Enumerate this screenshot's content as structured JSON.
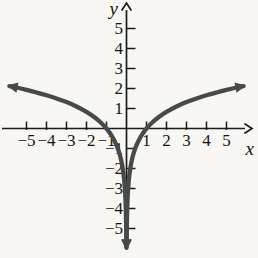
{
  "figure": {
    "background": "#f8f7f4",
    "axis_color": "#1b1b1b",
    "curve_color": "#494949",
    "label_color": "#141414"
  },
  "chart_data": {
    "type": "line",
    "title": "",
    "xlabel": "x",
    "ylabel": "y",
    "xlim": [
      -6,
      6
    ],
    "ylim": [
      -6.3,
      6.3
    ],
    "grid": false,
    "legend": "none",
    "x_ticks": [
      -5,
      -4,
      -3,
      -2,
      -1,
      1,
      2,
      3,
      4,
      5
    ],
    "x_tick_labels": [
      "−5",
      "−4",
      "−3",
      "−2",
      "−1",
      "1",
      "2",
      "3",
      "4",
      "5"
    ],
    "y_ticks": [
      5,
      4,
      3,
      2,
      1,
      -1,
      -2,
      -3,
      -4,
      -5
    ],
    "y_tick_labels": [
      "5",
      "4",
      "3",
      "2",
      "1",
      "−1",
      "−2",
      "−3",
      "−4",
      "−5"
    ],
    "curve_description": "Logarithmic curve of |x|: passes through (-1,0) and (1,0), falls to negative infinity as x approaches 0 (downward arrow at bottom of y-axis), rises slowly toward upper-left and upper-right arrows near y = 2 at |x| = 5.9",
    "series": [
      {
        "name": "left branch",
        "points": [
          [
            -0.007,
            -5.95
          ],
          [
            -0.011,
            -5.41
          ],
          [
            -0.018,
            -4.82
          ],
          [
            -0.03,
            -4.21
          ],
          [
            -0.05,
            -3.59
          ],
          [
            -0.075,
            -3.11
          ],
          [
            -0.11,
            -2.65
          ],
          [
            -0.16,
            -2.2
          ],
          [
            -0.22,
            -1.82
          ],
          [
            -0.3,
            -1.44
          ],
          [
            -0.4,
            -1.1
          ],
          [
            -0.5,
            -0.83
          ],
          [
            -0.65,
            -0.52
          ],
          [
            -0.8,
            -0.27
          ],
          [
            -1,
            0
          ],
          [
            -1.3,
            0.31
          ],
          [
            -1.6,
            0.56
          ],
          [
            -2,
            0.83
          ],
          [
            -2.5,
            1.1
          ],
          [
            -3,
            1.32
          ],
          [
            -3.5,
            1.5
          ],
          [
            -4,
            1.66
          ],
          [
            -4.5,
            1.8
          ],
          [
            -5,
            1.93
          ],
          [
            -5.5,
            2.05
          ],
          [
            -5.85,
            2.12
          ]
        ]
      },
      {
        "name": "right branch",
        "points": [
          [
            0.007,
            -5.95
          ],
          [
            0.011,
            -5.41
          ],
          [
            0.018,
            -4.82
          ],
          [
            0.03,
            -4.21
          ],
          [
            0.05,
            -3.59
          ],
          [
            0.075,
            -3.11
          ],
          [
            0.11,
            -2.65
          ],
          [
            0.16,
            -2.2
          ],
          [
            0.22,
            -1.82
          ],
          [
            0.3,
            -1.44
          ],
          [
            0.4,
            -1.1
          ],
          [
            0.5,
            -0.83
          ],
          [
            0.65,
            -0.52
          ],
          [
            0.8,
            -0.27
          ],
          [
            1,
            0
          ],
          [
            1.3,
            0.31
          ],
          [
            1.6,
            0.56
          ],
          [
            2,
            0.83
          ],
          [
            2.5,
            1.1
          ],
          [
            3,
            1.32
          ],
          [
            3.5,
            1.5
          ],
          [
            4,
            1.66
          ],
          [
            4.5,
            1.8
          ],
          [
            5,
            1.93
          ],
          [
            5.5,
            2.05
          ],
          [
            5.85,
            2.12
          ]
        ]
      }
    ],
    "arrows": {
      "x_axis_end": "right",
      "y_axis_end": "up",
      "curve_ends": [
        "upper-left",
        "upper-right",
        "down-at-origin"
      ]
    },
    "plot": {
      "origin_px": [
        126.5,
        128.5
      ],
      "px_per_unit": 20
    }
  }
}
